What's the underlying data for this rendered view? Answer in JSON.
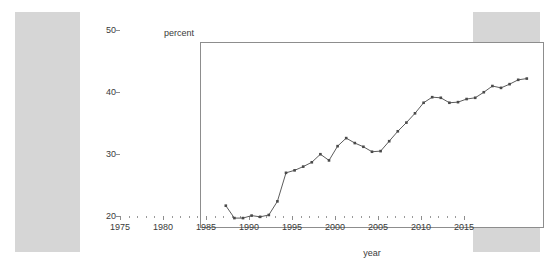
{
  "chart_data": {
    "type": "line",
    "title": "",
    "xlabel": "year",
    "ylabel": "percent",
    "xlim": [
      1975,
      2015
    ],
    "ylim": [
      20,
      50
    ],
    "grid": false,
    "legend": null,
    "x_ticks": [
      1975,
      1980,
      1985,
      1990,
      1995,
      2000,
      2005,
      2010,
      2015
    ],
    "x_tick_labels": [
      "1975",
      "1980",
      "1985",
      "1990",
      "1995",
      "2000",
      "2005",
      "2010",
      "2015"
    ],
    "x_minor_tick_step": 1,
    "y_ticks": [
      20,
      30,
      40,
      50
    ],
    "y_tick_labels": [
      "20",
      "30",
      "40",
      "50"
    ],
    "marker": "square",
    "line_color": "#4a4a4a",
    "marker_color": "#4a4a4a",
    "series": [
      {
        "name": "percent",
        "x": [
          1978,
          1979,
          1980,
          1981,
          1982,
          1983,
          1984,
          1985,
          1986,
          1987,
          1988,
          1989,
          1990,
          1991,
          1992,
          1993,
          1994,
          1995,
          1996,
          1997,
          1998,
          1999,
          2000,
          2001,
          2002,
          2003,
          2004,
          2005,
          2006,
          2007,
          2008,
          2009,
          2010,
          2011,
          2012,
          2013
        ],
        "values": [
          23.6,
          21.6,
          21.6,
          22.0,
          21.8,
          22.1,
          24.3,
          28.9,
          29.3,
          29.9,
          30.6,
          31.9,
          30.9,
          33.2,
          34.5,
          33.7,
          33.1,
          32.3,
          32.4,
          34.0,
          35.6,
          37.0,
          38.5,
          40.2,
          41.1,
          41.0,
          40.2,
          40.3,
          40.8,
          41.0,
          41.9,
          42.9,
          42.6,
          43.2,
          43.9,
          44.1
        ]
      }
    ]
  },
  "axes": {
    "y_axis_title": "percent",
    "x_axis_title": "year"
  }
}
